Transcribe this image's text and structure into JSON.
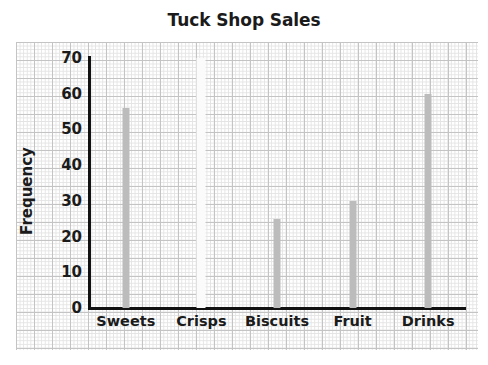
{
  "chart_data": {
    "type": "bar",
    "title": "Tuck Shop Sales",
    "xlabel": "",
    "ylabel": "Frequency",
    "categories": [
      "Sweets",
      "Crisps",
      "Biscuits",
      "Fruit",
      "Drinks"
    ],
    "values": [
      56,
      0,
      25,
      30,
      60
    ],
    "ylim": [
      0,
      70
    ],
    "ytick_labels": [
      "70",
      "60",
      "50",
      "40",
      "30",
      "20",
      "10",
      "0"
    ],
    "ytick_values": [
      70,
      60,
      50,
      40,
      30,
      20,
      10,
      0
    ],
    "ytick_step": 10,
    "grid": true,
    "grid_style": "graph-paper",
    "legend": null,
    "bar_color": "#bcbcbc",
    "axis_color": "#111111",
    "text_color": "#1b1b1b",
    "background_color": "#ffffff"
  }
}
